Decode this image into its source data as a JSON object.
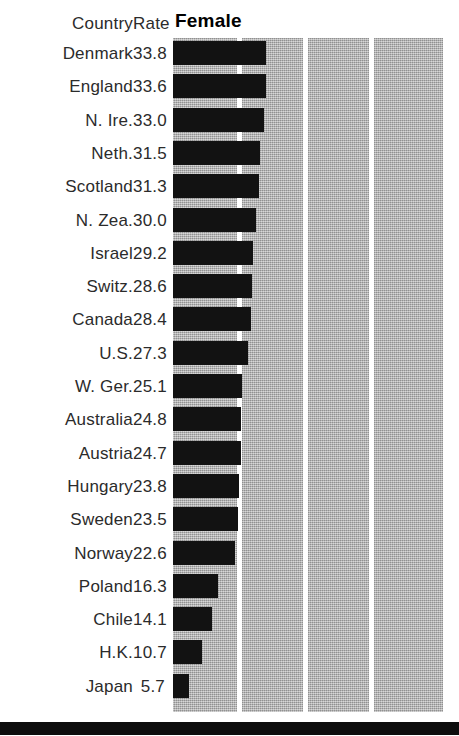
{
  "chart_data": {
    "type": "bar",
    "orientation": "horizontal",
    "title": "Female",
    "xlabel": "",
    "ylabel": "",
    "xlim": [
      0,
      98
    ],
    "grid": true,
    "gridlines": [
      24,
      48,
      72
    ],
    "legend": "none",
    "columns": [
      "Country",
      "Rate"
    ],
    "categories": [
      "Denmark",
      "England",
      "N. Ire.",
      "Neth.",
      "Scotland",
      "N. Zea.",
      "Israel",
      "Switz.",
      "Canada",
      "U.S.",
      "W. Ger.",
      "Australia",
      "Austria",
      "Hungary",
      "Sweden",
      "Norway",
      "Poland",
      "Chile",
      "H.K.",
      "Japan"
    ],
    "values": [
      33.8,
      33.6,
      33.0,
      31.5,
      31.3,
      30.0,
      29.2,
      28.6,
      28.4,
      27.3,
      25.1,
      24.8,
      24.7,
      23.8,
      23.5,
      22.6,
      16.3,
      14.1,
      10.7,
      5.7
    ],
    "value_labels": [
      "33.8",
      "33.6",
      "33.0",
      "31.5",
      "31.3",
      "30.0",
      "29.2",
      "28.6",
      "28.4",
      "27.3",
      "25.1",
      "24.8",
      "24.7",
      "23.8",
      "23.5",
      "22.6",
      "16.3",
      "14.1",
      "10.7",
      "5.7"
    ],
    "colors": {
      "bar": "#121212",
      "panel_background": "#b2b2b2",
      "gridline": "#ffffff",
      "text": "#2b2b2b",
      "rule": "#0d0d0d"
    }
  },
  "header": {
    "country": "Country",
    "rate": "Rate",
    "series": "Female"
  }
}
